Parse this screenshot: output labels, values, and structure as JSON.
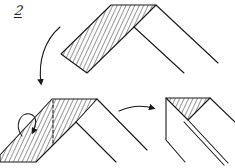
{
  "diagram": {
    "step_number": "2",
    "stroke_color": "#1a1a1a",
    "background": "#ffffff",
    "figures": [
      {
        "name": "initial-fold-state",
        "description": "Folded strip with hatched left band"
      },
      {
        "name": "intermediate-fold-state",
        "description": "Hatched band with dashed fold line and rotation arrow"
      },
      {
        "name": "final-fold-state",
        "description": "Hatched triangle with double diagonal edge"
      }
    ],
    "arrows": [
      {
        "name": "down-curved-arrow",
        "from": "initial-fold-state",
        "to": "intermediate-fold-state"
      },
      {
        "name": "right-curved-arrow",
        "from": "intermediate-fold-state",
        "to": "final-fold-state"
      },
      {
        "name": "fold-over-arrow",
        "description": "Semicircular arrow indicating fold over"
      }
    ]
  }
}
